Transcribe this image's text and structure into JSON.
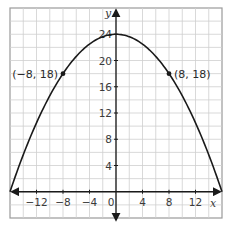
{
  "chart_data": {
    "type": "line",
    "title": "",
    "xlabel": "x",
    "ylabel": "y",
    "xlim": [
      -16,
      16
    ],
    "ylim": [
      -4,
      28
    ],
    "grid": true,
    "grid_step": 2,
    "x_ticks": [
      -12,
      -8,
      -4,
      0,
      4,
      8,
      12
    ],
    "x_tick_labels": [
      "−12",
      "−8",
      "−4",
      "0",
      "4",
      "8",
      "12"
    ],
    "y_ticks": [
      4,
      8,
      12,
      16,
      20,
      24
    ],
    "y_tick_labels": [
      "4",
      "8",
      "12",
      "16",
      "20",
      "24"
    ],
    "series": [
      {
        "name": "parabola",
        "equation": "y = -3/32 x^2 + 24",
        "a": -0.09375,
        "vertex": [
          0,
          24
        ],
        "x_range": [
          -16,
          16
        ],
        "color": "#1a1a1a"
      }
    ],
    "points": [
      {
        "x": -8,
        "y": 18,
        "label": "(−8, 18)",
        "label_side": "left"
      },
      {
        "x": 8,
        "y": 18,
        "label": "(8, 18)",
        "label_side": "right"
      }
    ],
    "colors": {
      "grid": "#cfcfcf",
      "frame": "#9a9a9a",
      "axis": "#1a1a1a",
      "curve": "#1a1a1a",
      "text": "#3a3a3a"
    }
  }
}
